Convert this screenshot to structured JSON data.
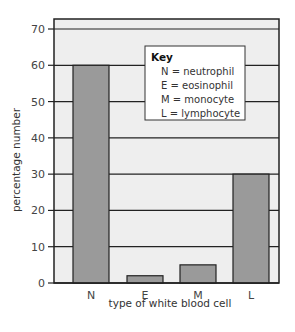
{
  "chart_data": {
    "type": "bar",
    "title": "",
    "xlabel": "type of white blood cell",
    "ylabel": "percentage number",
    "categories": [
      "N",
      "E",
      "M",
      "L"
    ],
    "values": [
      60,
      2,
      5,
      30
    ],
    "ylim": [
      0,
      70
    ],
    "yticks": [
      0,
      10,
      20,
      30,
      40,
      50,
      60,
      70
    ],
    "grid": true,
    "legend": {
      "title": "Key",
      "position": "upper-right",
      "entries": [
        "N = neutrophil",
        "E = eosinophil",
        "M = monocyte",
        "L = lymphocyte"
      ]
    },
    "colors": {
      "bar": "#9a9a9a",
      "plot_background": "#eeeeee",
      "grid": "#222222",
      "key_background": "#ffffff"
    }
  }
}
